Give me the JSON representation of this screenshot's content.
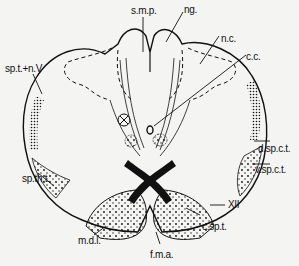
{
  "diagram": {
    "labels": {
      "smp": "s.m.p.",
      "ng": "ng.",
      "nc": "n.c.",
      "cc": "c.c.",
      "sptnV": "sp.t.+n.V",
      "dspct": "d.sp.c.t.",
      "vspct": "v.sp.c.t.",
      "spth": "sp.th.t.",
      "xii": "XII",
      "mdl": "m.d.l.",
      "csp": "c.sp.t.",
      "fma": "f.m.a."
    },
    "symbols": {
      "marker": "⊗"
    },
    "colors": {
      "background": "#f4f4f2",
      "ink": "#111111"
    }
  }
}
